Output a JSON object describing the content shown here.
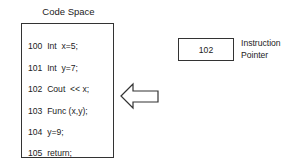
{
  "code_space": {
    "title": "Code Space",
    "lines": [
      {
        "addr": "100",
        "code": "Int  x=5;"
      },
      {
        "addr": "101",
        "code": "Int  y=7;"
      },
      {
        "addr": "102",
        "code": "Cout  << x;"
      },
      {
        "addr": "103",
        "code": "Func (x,y);"
      },
      {
        "addr": "104",
        "code": "y=9;"
      },
      {
        "addr": "105",
        "code": "return;"
      }
    ]
  },
  "instruction_pointer": {
    "value": "102",
    "label_line1": "Instruction",
    "label_line2": "Pointer"
  },
  "arrow": {
    "direction": "left",
    "points_to_line": "102"
  },
  "colors": {
    "stroke": "#333333",
    "text": "#222222",
    "background": "#ffffff"
  }
}
